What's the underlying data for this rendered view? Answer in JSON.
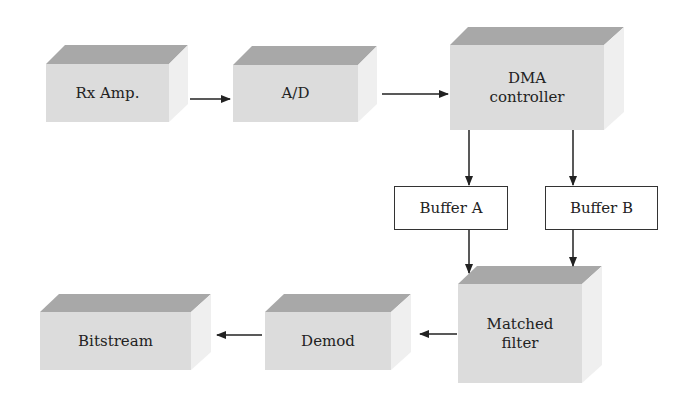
{
  "diagram": {
    "blocks": [
      {
        "id": "rx_amp",
        "label": "Rx Amp."
      },
      {
        "id": "ad",
        "label": "A/D"
      },
      {
        "id": "dma",
        "label": "DMA controller",
        "line1": "DMA",
        "line2": "controller"
      },
      {
        "id": "buffer_a",
        "label": "Buffer A"
      },
      {
        "id": "buffer_b",
        "label": "Buffer B"
      },
      {
        "id": "matched_filter",
        "label": "Matched filter",
        "line1": "Matched",
        "line2": "filter"
      },
      {
        "id": "demod",
        "label": "Demod"
      },
      {
        "id": "bitstream",
        "label": "Bitstream"
      }
    ],
    "edges": [
      {
        "from": "Rx Amp.",
        "to": "A/D"
      },
      {
        "from": "A/D",
        "to": "DMA controller"
      },
      {
        "from": "DMA controller",
        "to": "Buffer A"
      },
      {
        "from": "DMA controller",
        "to": "Buffer B"
      },
      {
        "from": "Buffer A",
        "to": "Matched filter"
      },
      {
        "from": "Buffer B",
        "to": "Matched filter"
      },
      {
        "from": "Matched filter",
        "to": "Demod"
      },
      {
        "from": "Demod",
        "to": "Bitstream"
      }
    ],
    "colors": {
      "front": "#dcdcdc",
      "top": "#a8a8a8",
      "side": "#efefef",
      "line": "#222222"
    }
  }
}
